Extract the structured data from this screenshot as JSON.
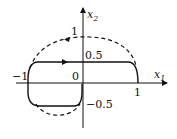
{
  "diagram": {
    "type": "phase-portrait",
    "axes": {
      "x_label": "x",
      "x_label_sub": "1",
      "y_label": "x",
      "y_label_sub": "2"
    },
    "ticks": {
      "origin": "0",
      "x_pos_one": "1",
      "x_neg_one": "−1",
      "y_one": "1",
      "y_half": "0.5",
      "y_neg_half": "−0.5"
    },
    "curves": [
      {
        "name": "solid-trajectory",
        "style": "solid",
        "description": "rounded rectangle path from (-1,0.5) to (1,0.5) to (1,0), left side down to (0,-0.5)"
      },
      {
        "name": "dashed-trajectory",
        "style": "dashed",
        "description": "ellipse-like arc through (0,1), (-1,0), (1,0), and lower arc to (0,-0.5)"
      }
    ],
    "colors": {
      "line": "#111111",
      "background": "#ffffff"
    }
  }
}
